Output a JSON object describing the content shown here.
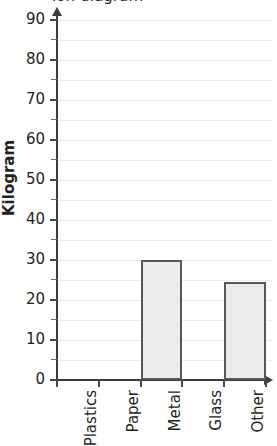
{
  "chart_data": {
    "type": "bar",
    "title": "ion diagram",
    "title_note": "clipped at top edge of screenshot",
    "xlabel": "",
    "ylabel": "Kilogram",
    "categories": [
      "Plastics",
      "Paper",
      "Metal",
      "Glass",
      "Other"
    ],
    "values": [
      0,
      0,
      30,
      0,
      24.5
    ],
    "ylim": [
      0,
      90
    ],
    "ytick_labels": [
      "0",
      "10",
      "20",
      "30",
      "40",
      "50",
      "60",
      "70",
      "80",
      "90"
    ],
    "ytick_values": [
      0,
      10,
      20,
      30,
      40,
      50,
      60,
      70,
      80,
      90
    ],
    "minor_tick_interval": 5,
    "grid": true,
    "grid_axis": "y",
    "legend": "none",
    "bar_fill_color": "#ebebeb",
    "bar_border_color": "#58585a",
    "axis_color": "#3b3b3d",
    "gridline_color": "#ececed",
    "text_color": "#231f20"
  }
}
